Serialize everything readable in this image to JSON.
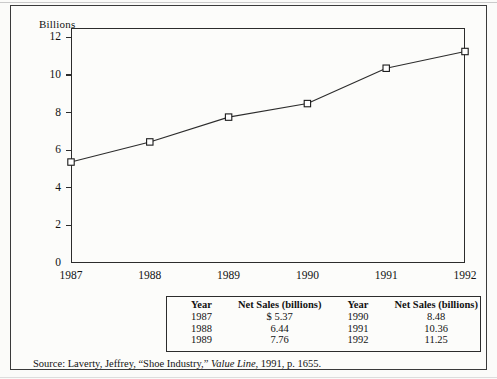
{
  "figure": {
    "axis_title": "Billions",
    "source_prefix": "Source:",
    "source_text_before": "Laverty, Jeffrey, “Shoe Industry,”",
    "source_italic": "Value Line",
    "source_text_after": ", 1991, p. 1655."
  },
  "chart_data": {
    "type": "line",
    "title": "",
    "xlabel": "",
    "ylabel": "Billions",
    "categories": [
      "1987",
      "1988",
      "1989",
      "1990",
      "1991",
      "1992"
    ],
    "values": [
      5.37,
      6.44,
      7.76,
      8.48,
      10.36,
      11.25
    ],
    "x_tick_labels": [
      "1987",
      "1988",
      "1989",
      "1990",
      "1991",
      "1992"
    ],
    "y_tick_labels": [
      "0",
      "2",
      "4",
      "6",
      "8",
      "10",
      "12"
    ],
    "y_ticks": [
      0,
      2,
      4,
      6,
      8,
      10,
      12
    ],
    "ylim": [
      0,
      12.5
    ],
    "grid": false,
    "legend": false,
    "marker": "open-square",
    "line_color": "#2c2c2c",
    "marker_fill": "#ffffff",
    "marker_edge": "#1a1a1a"
  },
  "table": {
    "headers": [
      "Year",
      "Net Sales (billions)",
      "Year",
      "Net Sales (billions)"
    ],
    "rows": [
      [
        "1987",
        "$ 5.37",
        "1990",
        "8.48"
      ],
      [
        "1988",
        "6.44",
        "1991",
        "10.36"
      ],
      [
        "1989",
        "7.76",
        "1992",
        "11.25"
      ]
    ]
  }
}
